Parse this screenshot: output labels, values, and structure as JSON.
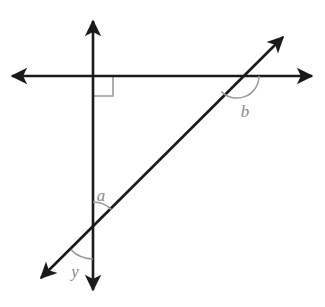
{
  "diagram": {
    "type": "geometry-angle-diagram",
    "canvas": {
      "width": 325,
      "height": 307,
      "background": "#ffffff"
    },
    "colors": {
      "line": "#1a1a1a",
      "label": "#8a8a8a",
      "arc": "#9a9a9a",
      "right_angle_mark": "#9a9a9a",
      "background": "#ffffff"
    },
    "lines": [
      {
        "name": "horizontal-line",
        "from": {
          "x": 12,
          "y": 76
        },
        "to": {
          "x": 312,
          "y": 76
        },
        "arrows": "both",
        "stroke_width": 2.6
      },
      {
        "name": "vertical-line",
        "from": {
          "x": 93,
          "y": 20
        },
        "to": {
          "x": 93,
          "y": 291
        },
        "arrows": "both",
        "stroke_width": 2.6
      },
      {
        "name": "diagonal-line",
        "from": {
          "x": 40,
          "y": 279
        },
        "to": {
          "x": 284,
          "y": 36
        },
        "arrows": "both",
        "stroke_width": 2.6
      }
    ],
    "intersections": [
      {
        "name": "vertical-horizontal",
        "x": 93,
        "y": 76
      },
      {
        "name": "diagonal-horizontal",
        "x": 237,
        "y": 76
      },
      {
        "name": "diagonal-vertical",
        "x": 93,
        "y": 228
      }
    ],
    "right_angle_marker": {
      "name": "right-angle-mark",
      "at": {
        "x": 93,
        "y": 76
      },
      "size": 20,
      "direction": "down-right"
    },
    "angles": [
      {
        "id": "a",
        "label": "a",
        "vertex": {
          "x": 93,
          "y": 228
        },
        "label_position": {
          "x": 101,
          "y": 201
        },
        "arc_radius": 26,
        "arc_start_deg": 90,
        "arc_end_deg": 45,
        "description": "angle between upward vertical ray and upper-right diagonal ray"
      },
      {
        "id": "b",
        "label": "b",
        "vertex": {
          "x": 237,
          "y": 76
        },
        "label_position": {
          "x": 243,
          "y": 117
        },
        "arc_radius": 22,
        "arc_start_deg": 0,
        "arc_end_deg": -135,
        "description": "angle below the horizontal line on the right side of the diagonal"
      },
      {
        "id": "y",
        "label": "y",
        "vertex": {
          "x": 93,
          "y": 228
        },
        "label_position": {
          "x": 71,
          "y": 277
        },
        "arc_radius": 31,
        "arc_start_deg": 225,
        "arc_end_deg": 270,
        "description": "angle between downward vertical ray and lower-left diagonal ray"
      }
    ]
  }
}
